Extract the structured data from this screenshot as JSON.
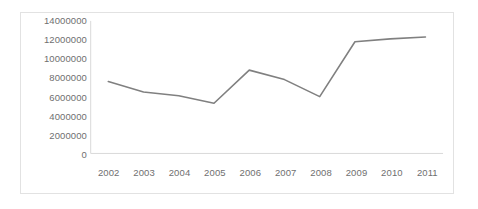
{
  "chart_data": {
    "type": "line",
    "title": "",
    "subtitle": "",
    "xlabel": "",
    "ylabel": "",
    "categories": [
      "2002",
      "2003",
      "2004",
      "2005",
      "2006",
      "2007",
      "2008",
      "2009",
      "2010",
      "2011"
    ],
    "values": [
      7600000,
      6500000,
      6100000,
      5300000,
      8800000,
      7800000,
      6000000,
      11800000,
      12100000,
      12300000
    ],
    "series": [
      {
        "name": "",
        "values": [
          7600000,
          6500000,
          6100000,
          5300000,
          8800000,
          7800000,
          6000000,
          11800000,
          12100000,
          12300000
        ],
        "color": "#808080"
      }
    ],
    "ylim": [
      0,
      14000000
    ],
    "ytick_values": [
      14000000,
      12000000,
      10000000,
      8000000,
      6000000,
      4000000,
      2000000,
      0
    ],
    "ytick_labels": [
      "14000000",
      "12000000",
      "10000000",
      "8000000",
      "6000000",
      "4000000",
      "2000000",
      "0"
    ],
    "xtick_labels": [
      "2002",
      "2003",
      "2004",
      "2005",
      "2006",
      "2007",
      "2008",
      "2009",
      "2010",
      "2011"
    ],
    "grid": false,
    "legend": false,
    "legend_position": "none",
    "annotations": [],
    "line_color": "#808080",
    "axis_color": "#d9d9d9",
    "border_color": "#e2e2e2",
    "background_color": "#ffffff",
    "marker": "none"
  }
}
